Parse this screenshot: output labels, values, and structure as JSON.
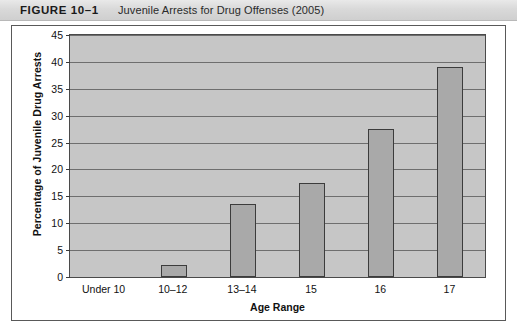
{
  "figure": {
    "label": "FIGURE 10–1",
    "title": "Juvenile Arrests for Drug Offenses (2005)"
  },
  "colors": {
    "plot_background": "#c6c6c6",
    "bar_fill": "#a9a9a9",
    "bar_border": "#3c3c3c",
    "gridline": "#6e6e6e",
    "frame_border": "#595959",
    "header_band": "#d9d9d9",
    "text": "#111111"
  },
  "chart_data": {
    "type": "bar",
    "title": "Juvenile Arrests for Drug Offenses (2005)",
    "xlabel": "Age Range",
    "ylabel": "Percentage of Juvenile Drug Arrests",
    "categories": [
      "Under 10",
      "10–12",
      "13–14",
      "15",
      "16",
      "17"
    ],
    "values": [
      0,
      2.2,
      13.5,
      17.5,
      27.5,
      39
    ],
    "ylim": [
      0,
      45
    ],
    "yticks": [
      0,
      5,
      10,
      15,
      20,
      25,
      30,
      35,
      40,
      45
    ],
    "ytick_labels": [
      "0",
      "5",
      "10",
      "15",
      "20",
      "25",
      "30",
      "35",
      "40",
      "45"
    ],
    "grid": true,
    "legend": false,
    "orientation": "vertical"
  }
}
